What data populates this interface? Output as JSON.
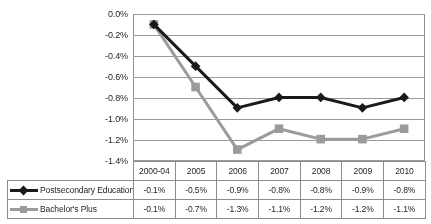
{
  "chart_data": {
    "type": "line",
    "title": "",
    "subtitle": "",
    "xlabel": "",
    "ylabel": "",
    "categories": [
      "2000-04",
      "2005",
      "2006",
      "2007",
      "2008",
      "2009",
      "2010"
    ],
    "ylim": [
      -1.4,
      0.0
    ],
    "ytick_labels": [
      "0.0%",
      "-0.2%",
      "-0.4%",
      "-0.6%",
      "-0.8%",
      "-1.0%",
      "-1.2%",
      "-1.4%"
    ],
    "ytick_values": [
      0.0,
      -0.2,
      -0.4,
      -0.6,
      -0.8,
      -1.0,
      -1.2,
      -1.4
    ],
    "grid": true,
    "legend_position": "data-table-left",
    "series": [
      {
        "name": "Postsecondary Education",
        "color": "#1a1a1a",
        "marker": "diamond",
        "values": [
          -0.1,
          -0.5,
          -0.9,
          -0.8,
          -0.8,
          -0.9,
          -0.8
        ],
        "labels": [
          "-0.1%",
          "-0.5%",
          "-0.9%",
          "-0.8%",
          "-0.8%",
          "-0.9%",
          "-0.8%"
        ]
      },
      {
        "name": "Bachelor's Plus",
        "color": "#9b9b9b",
        "marker": "square",
        "values": [
          -0.1,
          -0.7,
          -1.3,
          -1.1,
          -1.2,
          -1.2,
          -1.1
        ],
        "labels": [
          "-0.1%",
          "-0.7%",
          "-1.3%",
          "-1.1%",
          "-1.2%",
          "-1.2%",
          "-1.1%"
        ]
      }
    ]
  },
  "table": {
    "header_corner": "",
    "columns": [
      "2000-04",
      "2005",
      "2006",
      "2007",
      "2008",
      "2009",
      "2010"
    ],
    "rows": [
      {
        "label": "Postsecondary Education",
        "cells": [
          "-0.1%",
          "-0.5%",
          "-0.9%",
          "-0.8%",
          "-0.8%",
          "-0.9%",
          "-0.8%"
        ]
      },
      {
        "label": "Bachelor's Plus",
        "cells": [
          "-0.1%",
          "-0.7%",
          "-1.3%",
          "-1.1%",
          "-1.2%",
          "-1.2%",
          "-1.1%"
        ]
      }
    ]
  },
  "colors": {
    "series_dark": "#1a1a1a",
    "series_gray": "#9b9b9b",
    "gridline": "#9a9a9a",
    "border": "#8d8d8d",
    "background": "#ffffff"
  }
}
